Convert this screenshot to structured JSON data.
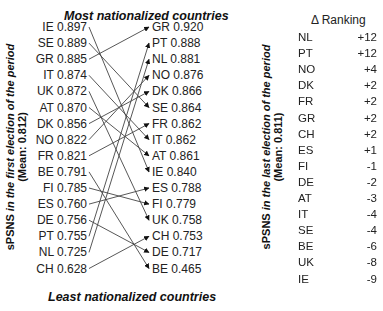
{
  "titles": {
    "top": "Most nationalized countries",
    "bottom": "Least nationalized countries"
  },
  "axes": {
    "left": {
      "prefix": "sPSNS ",
      "italic": "in the first election of the period",
      "mean": "(Mean: 0.812)"
    },
    "right": {
      "prefix": "sPSNS ",
      "italic": "in the last election of the period",
      "mean": "(Mean: 0.811)"
    }
  },
  "first_election": [
    {
      "country": "IE",
      "value": "0.897",
      "text": "IE 0.897"
    },
    {
      "country": "SE",
      "value": "0.889",
      "text": "SE 0.889"
    },
    {
      "country": "GR",
      "value": "0.885",
      "text": "GR 0.885"
    },
    {
      "country": "IT",
      "value": "0.874",
      "text": "IT 0.874"
    },
    {
      "country": "UK",
      "value": "0.872",
      "text": "UK 0.872"
    },
    {
      "country": "AT",
      "value": "0.870",
      "text": "AT 0.870"
    },
    {
      "country": "DK",
      "value": "0.856",
      "text": "DK 0.856"
    },
    {
      "country": "NO",
      "value": "0.822",
      "text": "NO 0.822"
    },
    {
      "country": "FR",
      "value": "0.821",
      "text": "FR 0.821"
    },
    {
      "country": "BE",
      "value": "0.791",
      "text": "BE 0.791"
    },
    {
      "country": "FI",
      "value": "0.785",
      "text": "FI 0.785"
    },
    {
      "country": "ES",
      "value": "0.760",
      "text": "ES 0.760"
    },
    {
      "country": "DE",
      "value": "0.756",
      "text": "DE 0.756"
    },
    {
      "country": "PT",
      "value": "0.755",
      "text": "PT 0.755"
    },
    {
      "country": "NL",
      "value": "0.725",
      "text": "NL 0.725"
    },
    {
      "country": "CH",
      "value": "0.628",
      "text": "CH 0.628"
    }
  ],
  "last_election": [
    {
      "country": "GR",
      "value": "0.920",
      "text": "GR 0.920"
    },
    {
      "country": "PT",
      "value": "0.888",
      "text": "PT 0.888"
    },
    {
      "country": "NL",
      "value": "0.881",
      "text": "NL 0.881"
    },
    {
      "country": "NO",
      "value": "0.876",
      "text": "NO 0.876"
    },
    {
      "country": "DK",
      "value": "0.866",
      "text": "DK 0.866"
    },
    {
      "country": "SE",
      "value": "0.864",
      "text": "SE 0.864"
    },
    {
      "country": "FR",
      "value": "0.862",
      "text": "FR 0.862"
    },
    {
      "country": "IT",
      "value": "0.862",
      "text": "IT 0.862"
    },
    {
      "country": "AT",
      "value": "0.861",
      "text": "AT 0.861"
    },
    {
      "country": "IE",
      "value": "0.840",
      "text": "IE 0.840"
    },
    {
      "country": "ES",
      "value": "0.788",
      "text": "ES 0.788"
    },
    {
      "country": "FI",
      "value": "0.779",
      "text": "FI 0.779"
    },
    {
      "country": "UK",
      "value": "0.758",
      "text": "UK 0.758"
    },
    {
      "country": "CH",
      "value": "0.753",
      "text": "CH 0.753"
    },
    {
      "country": "DE",
      "value": "0.717",
      "text": "DE 0.717"
    },
    {
      "country": "BE",
      "value": "0.465",
      "text": "BE 0.465"
    }
  ],
  "ranking": {
    "header": "Δ Ranking",
    "rows": [
      {
        "country": "NL",
        "delta": "+12"
      },
      {
        "country": "PT",
        "delta": "+12"
      },
      {
        "country": "NO",
        "delta": "+4"
      },
      {
        "country": "DK",
        "delta": "+2"
      },
      {
        "country": "FR",
        "delta": "+2"
      },
      {
        "country": "GR",
        "delta": "+2"
      },
      {
        "country": "CH",
        "delta": "+2"
      },
      {
        "country": "ES",
        "delta": "+1"
      },
      {
        "country": "FI",
        "delta": "-1"
      },
      {
        "country": "DE",
        "delta": "-2"
      },
      {
        "country": "AT",
        "delta": "-3"
      },
      {
        "country": "IT",
        "delta": "-4"
      },
      {
        "country": "SE",
        "delta": "-4"
      },
      {
        "country": "BE",
        "delta": "-6"
      },
      {
        "country": "UK",
        "delta": "-8"
      },
      {
        "country": "IE",
        "delta": "-9"
      }
    ]
  },
  "colors": {
    "line": "#444444",
    "text": "#222222"
  }
}
